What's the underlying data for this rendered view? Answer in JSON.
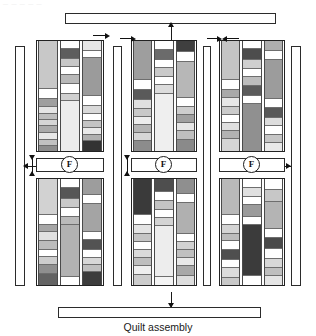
{
  "page": {
    "header_artifact": "— — — — —",
    "caption": "Quilt assembly",
    "width": 316,
    "height": 336
  },
  "colors": {
    "outline": "#222222",
    "seam_line": "#6e6e6e",
    "white": "#ffffff",
    "leader": "#1a1a1a",
    "v_light": "#f2f2f2",
    "light": "#e2e2e2",
    "light_mid": "#cfcfcf",
    "mid": "#b5b5b5",
    "mid_dark": "#9a9a9a",
    "dark": "#6f6f6f",
    "v_dark": "#4a4a4a",
    "near_black": "#2f2f2f"
  },
  "labels": {
    "block_badge": "F"
  },
  "borders": {
    "top_sashing": {
      "label": "top-border-strip"
    },
    "bottom_sashing": {
      "label": "bottom-border-strip"
    },
    "left_sashing": {
      "label": "left-border-strip"
    },
    "inner_sashing": {
      "label": "inner-vertical-sashing"
    },
    "right_sashing": {
      "label": "right-border-strip"
    }
  },
  "blocks": [
    {
      "name": "block-left-top",
      "columns": [
        {
          "segments": [
            {
              "h": 62,
              "c": "#c8c8c8"
            },
            {
              "h": 13,
              "c": "#ffffff"
            },
            {
              "h": 10,
              "c": "#9f9f9f"
            },
            {
              "h": 9,
              "c": "#e4e4e4"
            },
            {
              "h": 8,
              "c": "#bdbdbd"
            },
            {
              "h": 8,
              "c": "#d6d6d6"
            },
            {
              "h": 9,
              "c": "#ababab"
            },
            {
              "h": 9,
              "c": "#e8e8e8"
            },
            {
              "h": 8,
              "c": "#c2c2c2"
            },
            {
              "h": 6,
              "c": "#8d8d8d"
            }
          ]
        },
        {
          "segments": [
            {
              "h": 10,
              "c": "#ffffff"
            },
            {
              "h": 13,
              "c": "#5d5d5d"
            },
            {
              "h": 11,
              "c": "#c7c7c7"
            },
            {
              "h": 10,
              "c": "#ffffff"
            },
            {
              "h": 11,
              "c": "#b9b9b9"
            },
            {
              "h": 13,
              "c": "#ffffff"
            },
            {
              "h": 10,
              "c": "#d0d0d0"
            },
            {
              "h": 64,
              "c": "#ededed"
            }
          ]
        },
        {
          "segments": [
            {
              "h": 13,
              "c": "#e6e6e6"
            },
            {
              "h": 9,
              "c": "#ffffff"
            },
            {
              "h": 49,
              "c": "#9b9b9b"
            },
            {
              "h": 12,
              "c": "#ffffff"
            },
            {
              "h": 10,
              "c": "#d9d9d9"
            },
            {
              "h": 9,
              "c": "#ffffff"
            },
            {
              "h": 9,
              "c": "#c4c4c4"
            },
            {
              "h": 9,
              "c": "#e9e9e9"
            },
            {
              "h": 8,
              "c": "#b0b0b0"
            },
            {
              "h": 13,
              "c": "#333333"
            }
          ]
        }
      ]
    },
    {
      "name": "block-left-bottom",
      "columns": [
        {
          "segments": [
            {
              "h": 46,
              "c": "#d2d2d2"
            },
            {
              "h": 12,
              "c": "#ffffff"
            },
            {
              "h": 10,
              "c": "#a6a6a6"
            },
            {
              "h": 11,
              "c": "#e0e0e0"
            },
            {
              "h": 11,
              "c": "#bcbcbc"
            },
            {
              "h": 10,
              "c": "#ffffff"
            },
            {
              "h": 10,
              "c": "#cdcdcd"
            },
            {
              "h": 11,
              "c": "#8f8f8f"
            },
            {
              "h": 14,
              "c": "#636363"
            }
          ]
        },
        {
          "segments": [
            {
              "h": 12,
              "c": "#ffffff"
            },
            {
              "h": 14,
              "c": "#565656"
            },
            {
              "h": 11,
              "c": "#c9c9c9"
            },
            {
              "h": 11,
              "c": "#ffffff"
            },
            {
              "h": 10,
              "c": "#bbbbbb"
            },
            {
              "h": 67,
              "c": "#b2b2b2"
            },
            {
              "h": 10,
              "c": "#ffffff"
            }
          ]
        },
        {
          "segments": [
            {
              "h": 20,
              "c": "#9d9d9d"
            },
            {
              "h": 12,
              "c": "#ffffff"
            },
            {
              "h": 36,
              "c": "#a4a4a4"
            },
            {
              "h": 10,
              "c": "#ffffff"
            },
            {
              "h": 12,
              "c": "#535353"
            },
            {
              "h": 10,
              "c": "#ffffff"
            },
            {
              "h": 10,
              "c": "#d8d8d8"
            },
            {
              "h": 9,
              "c": "#c0c0c0"
            },
            {
              "h": 16,
              "c": "#3c3c3c"
            }
          ]
        }
      ]
    },
    {
      "name": "block-center-top",
      "columns": [
        {
          "segments": [
            {
              "h": 48,
              "c": "#9e9e9e"
            },
            {
              "h": 12,
              "c": "#ffffff"
            },
            {
              "h": 12,
              "c": "#5a5a5a"
            },
            {
              "h": 11,
              "c": "#e0e0e0"
            },
            {
              "h": 10,
              "c": "#c8c8c8"
            },
            {
              "h": 9,
              "c": "#ececec"
            },
            {
              "h": 10,
              "c": "#b4b4b4"
            },
            {
              "h": 10,
              "c": "#d6d6d6"
            },
            {
              "h": 12,
              "c": "#8c8c8c"
            }
          ]
        },
        {
          "segments": [
            {
              "h": 11,
              "c": "#ffffff"
            },
            {
              "h": 12,
              "c": "#6b6b6b"
            },
            {
              "h": 10,
              "c": "#ffffff"
            },
            {
              "h": 11,
              "c": "#cacaca"
            },
            {
              "h": 10,
              "c": "#ffffff"
            },
            {
              "h": 11,
              "c": "#dcdcdc"
            },
            {
              "h": 69,
              "c": "#efefef"
            }
          ]
        },
        {
          "segments": [
            {
              "h": 14,
              "c": "#3f3f3f"
            },
            {
              "h": 11,
              "c": "#ffffff"
            },
            {
              "h": 44,
              "c": "#b7b7b7"
            },
            {
              "h": 11,
              "c": "#ffffff"
            },
            {
              "h": 10,
              "c": "#cecece"
            },
            {
              "h": 10,
              "c": "#a0a0a0"
            },
            {
              "h": 10,
              "c": "#e6e6e6"
            },
            {
              "h": 11,
              "c": "#bfbfbf"
            },
            {
              "h": 13,
              "c": "#8a8a8a"
            }
          ]
        }
      ]
    },
    {
      "name": "block-center-bottom",
      "columns": [
        {
          "segments": [
            {
              "h": 44,
              "c": "#3a3a3a"
            },
            {
              "h": 12,
              "c": "#ffffff"
            },
            {
              "h": 11,
              "c": "#e4e4e4"
            },
            {
              "h": 10,
              "c": "#c5c5c5"
            },
            {
              "h": 10,
              "c": "#ffffff"
            },
            {
              "h": 10,
              "c": "#dadada"
            },
            {
              "h": 10,
              "c": "#bebebe"
            },
            {
              "h": 11,
              "c": "#eeeeee"
            },
            {
              "h": 12,
              "c": "#cccccc"
            }
          ]
        },
        {
          "segments": [
            {
              "h": 16,
              "c": "#4e4e4e"
            },
            {
              "h": 11,
              "c": "#ffffff"
            },
            {
              "h": 11,
              "c": "#c3c3c3"
            },
            {
              "h": 10,
              "c": "#ffffff"
            },
            {
              "h": 10,
              "c": "#d4d4d4"
            },
            {
              "h": 63,
              "c": "#ededed"
            },
            {
              "h": 10,
              "c": "#f4f4f4"
            }
          ]
        },
        {
          "segments": [
            {
              "h": 19,
              "c": "#8f8f8f"
            },
            {
              "h": 11,
              "c": "#ffffff"
            },
            {
              "h": 38,
              "c": "#b0b0b0"
            },
            {
              "h": 10,
              "c": "#ffffff"
            },
            {
              "h": 10,
              "c": "#d2d2d2"
            },
            {
              "h": 10,
              "c": "#c0c0c0"
            },
            {
              "h": 10,
              "c": "#e8e8e8"
            },
            {
              "h": 12,
              "c": "#a8a8a8"
            },
            {
              "h": 11,
              "c": "#dddddd"
            }
          ]
        }
      ]
    },
    {
      "name": "block-right-top",
      "columns": [
        {
          "segments": [
            {
              "h": 48,
              "c": "#c4c4c4"
            },
            {
              "h": 12,
              "c": "#ffffff"
            },
            {
              "h": 10,
              "c": "#a9a9a9"
            },
            {
              "h": 10,
              "c": "#e7e7e7"
            },
            {
              "h": 10,
              "c": "#cbcbcb"
            },
            {
              "h": 10,
              "c": "#ffffff"
            },
            {
              "h": 10,
              "c": "#dfdfdf"
            },
            {
              "h": 10,
              "c": "#b2b2b2"
            },
            {
              "h": 14,
              "c": "#d5d5d5"
            }
          ]
        },
        {
          "segments": [
            {
              "h": 10,
              "c": "#ffffff"
            },
            {
              "h": 13,
              "c": "#4d4d4d"
            },
            {
              "h": 11,
              "c": "#cfcfcf"
            },
            {
              "h": 10,
              "c": "#ffffff"
            },
            {
              "h": 11,
              "c": "#bdbdbd"
            },
            {
              "h": 12,
              "c": "#5b5b5b"
            },
            {
              "h": 10,
              "c": "#ffffff"
            },
            {
              "h": 57,
              "c": "#909090"
            }
          ]
        },
        {
          "segments": [
            {
              "h": 12,
              "c": "#aeaeae"
            },
            {
              "h": 11,
              "c": "#ffffff"
            },
            {
              "h": 48,
              "c": "#9c9c9c"
            },
            {
              "h": 11,
              "c": "#ffffff"
            },
            {
              "h": 12,
              "c": "#585858"
            },
            {
              "h": 10,
              "c": "#dddddd"
            },
            {
              "h": 10,
              "c": "#ffffff"
            },
            {
              "h": 10,
              "c": "#c6c6c6"
            },
            {
              "h": 10,
              "c": "#e9e9e9"
            }
          ]
        }
      ]
    },
    {
      "name": "block-right-bottom",
      "columns": [
        {
          "segments": [
            {
              "h": 46,
              "c": "#b9b9b9"
            },
            {
              "h": 12,
              "c": "#ffffff"
            },
            {
              "h": 11,
              "c": "#d4d4d4"
            },
            {
              "h": 10,
              "c": "#bcbcbc"
            },
            {
              "h": 11,
              "c": "#ffffff"
            },
            {
              "h": 12,
              "c": "#4f4f4f"
            },
            {
              "h": 11,
              "c": "#ffffff"
            },
            {
              "h": 12,
              "c": "#dcdcdc"
            },
            {
              "h": 9,
              "c": "#c9c9c9"
            }
          ]
        },
        {
          "segments": [
            {
              "h": 10,
              "c": "#ffffff"
            },
            {
              "h": 11,
              "c": "#e0e0e0"
            },
            {
              "h": 10,
              "c": "#ffffff"
            },
            {
              "h": 13,
              "c": "#9b9b9b"
            },
            {
              "h": 10,
              "c": "#ffffff"
            },
            {
              "h": 60,
              "c": "#3b3b3b"
            },
            {
              "h": 10,
              "c": "#ffffff"
            }
          ]
        },
        {
          "segments": [
            {
              "h": 13,
              "c": "#ffffff"
            },
            {
              "h": 14,
              "c": "#c7c7c7"
            },
            {
              "h": 32,
              "c": "#b4b4b4"
            },
            {
              "h": 11,
              "c": "#ffffff"
            },
            {
              "h": 13,
              "c": "#4a4a4a"
            },
            {
              "h": 11,
              "c": "#ffffff"
            },
            {
              "h": 11,
              "c": "#d8d8d8"
            },
            {
              "h": 10,
              "c": "#bfbfbf"
            },
            {
              "h": 10,
              "c": "#e5e5e5"
            }
          ]
        }
      ]
    }
  ],
  "annotations": {
    "press_arrows": [
      {
        "name": "press-arrow-top-left",
        "dir": "right"
      },
      {
        "name": "press-arrow-top-center-a",
        "dir": "right"
      },
      {
        "name": "press-arrow-top-center-b",
        "dir": "right"
      },
      {
        "name": "press-arrow-top-right-a",
        "dir": "right"
      },
      {
        "name": "press-arrow-top-right-b",
        "dir": "left"
      },
      {
        "name": "press-arrow-left-sash",
        "dir": "both-vertical"
      },
      {
        "name": "press-arrow-center-sash",
        "dir": "both-vertical"
      },
      {
        "name": "press-arrow-right-sash",
        "dir": "right"
      }
    ],
    "leader_lines": [
      {
        "name": "top-border-leader"
      },
      {
        "name": "bottom-border-leader"
      },
      {
        "name": "left-border-leader"
      },
      {
        "name": "right-border-leader"
      }
    ]
  }
}
